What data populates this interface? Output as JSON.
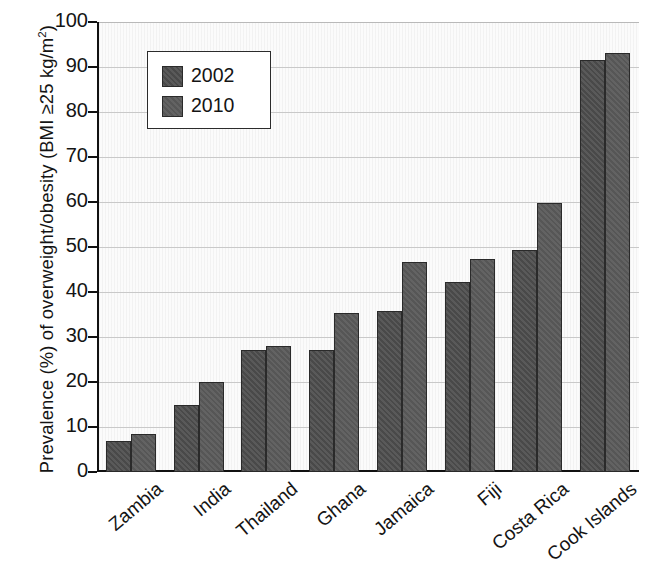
{
  "chart_data": {
    "type": "bar",
    "title": "",
    "xlabel": "",
    "ylabel": "Prevalence (%) of overweight/obesity (BMI ≥25 kg/m2)",
    "ylabel_parts": {
      "main": "Prevalence (%) of overweight/obesity (BMI ≥25 kg/m",
      "superscript": "2",
      "tail": ")"
    },
    "categories": [
      "Zambia",
      "India",
      "Thailand",
      "Ghana",
      "Jamaica",
      "Fiji",
      "Costa Rica",
      "Cook Islands"
    ],
    "series": [
      {
        "name": "2002",
        "color": "#4d4d4d",
        "values": [
          6.9,
          14.9,
          27.2,
          27.2,
          35.8,
          42.3,
          49.4,
          91.6
        ]
      },
      {
        "name": "2010",
        "color": "#595959",
        "values": [
          8.4,
          20.1,
          28.0,
          35.3,
          46.6,
          47.3,
          59.8,
          93.1
        ]
      }
    ],
    "ylim": [
      0,
      100
    ],
    "ytick_values": [
      100,
      90,
      80,
      70,
      60,
      50,
      40,
      30,
      20,
      10,
      0
    ],
    "ytick_labels": [
      "100",
      "90",
      "80",
      "70",
      "60",
      "50",
      "40",
      "30",
      "20",
      "10",
      "0"
    ],
    "grid": "horizontal",
    "legend_position": "upper-left-inside",
    "legend_entries": [
      "2002",
      "2010"
    ],
    "background_color": "#fbfbfb",
    "gridline_color": "#c9c9c9",
    "axis_color": "#111111"
  }
}
